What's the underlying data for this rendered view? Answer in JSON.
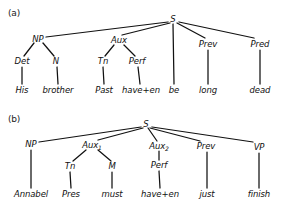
{
  "figure": {
    "type": "syntax-tree-diagram",
    "panels": [
      {
        "id": "a",
        "label": "(a)",
        "label_pos": {
          "x": 8,
          "y": 8
        },
        "sentence": "His brother Past have+en be long dead",
        "nodes": [
          {
            "id": "a-S",
            "text": "S",
            "x": 173,
            "y": 19,
            "kind": "nonterminal"
          },
          {
            "id": "a-NP",
            "text": "NP",
            "x": 38,
            "y": 39,
            "kind": "nonterminal"
          },
          {
            "id": "a-Aux",
            "text": "Aux",
            "x": 119,
            "y": 40,
            "kind": "nonterminal"
          },
          {
            "id": "a-Prev",
            "text": "Prev",
            "x": 208,
            "y": 44,
            "kind": "nonterminal"
          },
          {
            "id": "a-Pred",
            "text": "Pred",
            "x": 260,
            "y": 44,
            "kind": "nonterminal"
          },
          {
            "id": "a-Det",
            "text": "Det",
            "x": 22,
            "y": 61,
            "kind": "nonterminal"
          },
          {
            "id": "a-N",
            "text": "N",
            "x": 56,
            "y": 61,
            "kind": "nonterminal"
          },
          {
            "id": "a-Tn",
            "text": "Tn",
            "x": 103,
            "y": 61,
            "kind": "nonterminal"
          },
          {
            "id": "a-Perf",
            "text": "Perf",
            "x": 137,
            "y": 61,
            "kind": "nonterminal"
          },
          {
            "id": "a-His",
            "text": "His",
            "x": 22,
            "y": 90,
            "kind": "terminal"
          },
          {
            "id": "a-brother",
            "text": "brother",
            "x": 58,
            "y": 90,
            "kind": "terminal"
          },
          {
            "id": "a-Past",
            "text": "Past",
            "x": 104,
            "y": 90,
            "kind": "terminal"
          },
          {
            "id": "a-haveen",
            "text": "have+en",
            "x": 141,
            "y": 90,
            "kind": "terminal"
          },
          {
            "id": "a-be",
            "text": "be",
            "x": 174,
            "y": 90,
            "kind": "terminal"
          },
          {
            "id": "a-long",
            "text": "long",
            "x": 208,
            "y": 90,
            "kind": "terminal"
          },
          {
            "id": "a-dead",
            "text": "dead",
            "x": 260,
            "y": 90,
            "kind": "terminal"
          }
        ],
        "edges": [
          {
            "from": "a-S",
            "to": "a-NP",
            "x1": 168,
            "y1": 22,
            "x2": 46,
            "y2": 37
          },
          {
            "from": "a-S",
            "to": "a-Aux",
            "x1": 170,
            "y1": 23,
            "x2": 122,
            "y2": 35
          },
          {
            "from": "a-S",
            "to": "a-be",
            "x1": 173,
            "y1": 24,
            "x2": 174,
            "y2": 84
          },
          {
            "from": "a-S",
            "to": "a-Prev",
            "x1": 177,
            "y1": 23,
            "x2": 205,
            "y2": 38
          },
          {
            "from": "a-S",
            "to": "a-Pred",
            "x1": 179,
            "y1": 22,
            "x2": 254,
            "y2": 38
          },
          {
            "from": "a-NP",
            "to": "a-Det",
            "x1": 34,
            "y1": 43,
            "x2": 24,
            "y2": 56
          },
          {
            "from": "a-NP",
            "to": "a-N",
            "x1": 43,
            "y1": 43,
            "x2": 54,
            "y2": 56
          },
          {
            "from": "a-Aux",
            "to": "a-Tn",
            "x1": 114,
            "y1": 45,
            "x2": 105,
            "y2": 56
          },
          {
            "from": "a-Aux",
            "to": "a-Perf",
            "x1": 124,
            "y1": 45,
            "x2": 135,
            "y2": 56
          },
          {
            "from": "a-Det",
            "to": "a-His",
            "x1": 22,
            "y1": 67,
            "x2": 22,
            "y2": 84
          },
          {
            "from": "a-N",
            "to": "a-brother",
            "x1": 57,
            "y1": 67,
            "x2": 58,
            "y2": 84
          },
          {
            "from": "a-Tn",
            "to": "a-Past",
            "x1": 103,
            "y1": 67,
            "x2": 104,
            "y2": 84
          },
          {
            "from": "a-Perf",
            "to": "a-haveen",
            "x1": 138,
            "y1": 67,
            "x2": 140,
            "y2": 84
          },
          {
            "from": "a-Prev",
            "to": "a-long",
            "x1": 208,
            "y1": 50,
            "x2": 208,
            "y2": 84
          },
          {
            "from": "a-Pred",
            "to": "a-dead",
            "x1": 260,
            "y1": 50,
            "x2": 260,
            "y2": 84
          }
        ]
      },
      {
        "id": "b",
        "label": "(b)",
        "label_pos": {
          "x": 8,
          "y": 114
        },
        "sentence": "Annabel Pres must have+en just finish",
        "nodes": [
          {
            "id": "b-S",
            "text": "S",
            "sub": "",
            "x": 146,
            "y": 124,
            "kind": "nonterminal"
          },
          {
            "id": "b-NP",
            "text": "NP",
            "sub": "",
            "x": 31,
            "y": 144,
            "kind": "nonterminal"
          },
          {
            "id": "b-Aux1",
            "text": "Aux",
            "sub": "1",
            "x": 92,
            "y": 145,
            "kind": "nonterminal"
          },
          {
            "id": "b-Aux2",
            "text": "Aux",
            "sub": "2",
            "x": 159,
            "y": 146,
            "kind": "nonterminal"
          },
          {
            "id": "b-Prev",
            "text": "Prev",
            "sub": "",
            "x": 206,
            "y": 146,
            "kind": "nonterminal"
          },
          {
            "id": "b-VP",
            "text": "VP",
            "sub": "",
            "x": 259,
            "y": 147,
            "kind": "nonterminal"
          },
          {
            "id": "b-Tn",
            "text": "Tn",
            "sub": "",
            "x": 70,
            "y": 166,
            "kind": "nonterminal"
          },
          {
            "id": "b-M",
            "text": "M",
            "sub": "",
            "x": 112,
            "y": 166,
            "kind": "nonterminal"
          },
          {
            "id": "b-Perf",
            "text": "Perf",
            "sub": "",
            "x": 159,
            "y": 165,
            "kind": "nonterminal"
          },
          {
            "id": "b-Annabel",
            "text": "Annabel",
            "sub": "",
            "x": 31,
            "y": 194,
            "kind": "terminal"
          },
          {
            "id": "b-Pres",
            "text": "Pres",
            "sub": "",
            "x": 71,
            "y": 194,
            "kind": "terminal"
          },
          {
            "id": "b-must",
            "text": "must",
            "sub": "",
            "x": 112,
            "y": 194,
            "kind": "terminal"
          },
          {
            "id": "b-haveen",
            "text": "have+en",
            "sub": "",
            "x": 160,
            "y": 194,
            "kind": "terminal"
          },
          {
            "id": "b-just",
            "text": "just",
            "sub": "",
            "x": 207,
            "y": 194,
            "kind": "terminal"
          },
          {
            "id": "b-finish",
            "text": "finish",
            "sub": "",
            "x": 259,
            "y": 194,
            "kind": "terminal"
          }
        ],
        "edges": [
          {
            "from": "b-S",
            "to": "b-NP",
            "x1": 141,
            "y1": 127,
            "x2": 39,
            "y2": 142
          },
          {
            "from": "b-S",
            "to": "b-Aux1",
            "x1": 143,
            "y1": 128,
            "x2": 98,
            "y2": 140
          },
          {
            "from": "b-S",
            "to": "b-Aux2",
            "x1": 148,
            "y1": 128,
            "x2": 157,
            "y2": 141
          },
          {
            "from": "b-S",
            "to": "b-Prev",
            "x1": 150,
            "y1": 128,
            "x2": 200,
            "y2": 141
          },
          {
            "from": "b-S",
            "to": "b-VP",
            "x1": 152,
            "y1": 127,
            "x2": 253,
            "y2": 142
          },
          {
            "from": "b-NP",
            "to": "b-Annabel",
            "x1": 31,
            "y1": 150,
            "x2": 31,
            "y2": 188
          },
          {
            "from": "b-Aux1",
            "to": "b-Tn",
            "x1": 86,
            "y1": 150,
            "x2": 73,
            "y2": 161
          },
          {
            "from": "b-Aux1",
            "to": "b-M",
            "x1": 98,
            "y1": 150,
            "x2": 111,
            "y2": 161
          },
          {
            "from": "b-Aux2",
            "to": "b-Perf",
            "x1": 159,
            "y1": 151,
            "x2": 159,
            "y2": 160
          },
          {
            "from": "b-Tn",
            "to": "b-Pres",
            "x1": 70,
            "y1": 172,
            "x2": 71,
            "y2": 188
          },
          {
            "from": "b-M",
            "to": "b-must",
            "x1": 112,
            "y1": 172,
            "x2": 112,
            "y2": 188
          },
          {
            "from": "b-Perf",
            "to": "b-haveen",
            "x1": 159,
            "y1": 171,
            "x2": 160,
            "y2": 188
          },
          {
            "from": "b-Prev",
            "to": "b-just",
            "x1": 207,
            "y1": 152,
            "x2": 207,
            "y2": 188
          },
          {
            "from": "b-VP",
            "to": "b-finish",
            "x1": 259,
            "y1": 153,
            "x2": 259,
            "y2": 188
          }
        ]
      }
    ]
  },
  "colors": {
    "ink": "#111111",
    "background": "#ffffff"
  }
}
